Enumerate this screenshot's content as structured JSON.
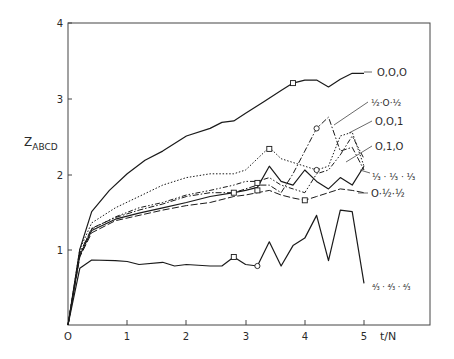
{
  "chart_data": {
    "type": "line",
    "title": "",
    "xlabel": "t/N",
    "ylabel": "Z_ABCD",
    "ylabel_main": "Z",
    "ylabel_sub": "ABCD",
    "xlim": [
      0,
      6.1
    ],
    "ylim": [
      0,
      4
    ],
    "x_ticks": [
      0,
      1,
      2,
      3,
      4,
      5
    ],
    "x_tick_labels": [
      "O",
      "1",
      "2",
      "3",
      "4",
      "5"
    ],
    "y_ticks": [
      1,
      2,
      3,
      4
    ],
    "y_tick_labels": [
      "1",
      "2",
      "3",
      "4"
    ],
    "grid": false,
    "legend_position": "inline labels at right end of each curve",
    "series": [
      {
        "name": "0,0,0",
        "label": "O,O,O",
        "style": "solid",
        "x": [
          0,
          0.2,
          0.4,
          0.7,
          1.0,
          1.3,
          1.6,
          2.0,
          2.4,
          2.6,
          2.8,
          3.0,
          3.3,
          3.6,
          3.8,
          4.0,
          4.2,
          4.4,
          4.6,
          4.8,
          5.0
        ],
        "y": [
          0,
          1.0,
          1.5,
          1.78,
          2.0,
          2.18,
          2.3,
          2.5,
          2.6,
          2.68,
          2.7,
          2.8,
          2.95,
          3.1,
          3.2,
          3.24,
          3.24,
          3.15,
          3.25,
          3.33,
          3.33
        ],
        "markers": [
          {
            "x": 3.8,
            "y": 3.2,
            "shape": "square"
          }
        ]
      },
      {
        "name": "1/2,0,1/2",
        "label": "½·O·½",
        "style": "dash-dot",
        "x": [
          0,
          0.2,
          0.4,
          0.8,
          1.2,
          1.6,
          2.0,
          2.4,
          2.8,
          3.0,
          3.2,
          3.4,
          3.6,
          3.8,
          4.0,
          4.2,
          4.4,
          4.6,
          4.8,
          5.0
        ],
        "y": [
          0,
          0.95,
          1.28,
          1.42,
          1.52,
          1.6,
          1.7,
          1.75,
          1.75,
          1.8,
          1.85,
          1.85,
          1.75,
          2.0,
          2.3,
          2.6,
          2.75,
          2.3,
          2.35,
          2.05
        ],
        "markers": [
          {
            "x": 4.2,
            "y": 2.6,
            "shape": "circle"
          }
        ]
      },
      {
        "name": "0,0,1",
        "label": "O,O,1",
        "style": "dotted",
        "x": [
          0,
          0.2,
          0.4,
          0.8,
          1.2,
          1.6,
          2.0,
          2.4,
          2.8,
          3.0,
          3.4,
          3.6,
          3.8,
          4.0,
          4.2,
          4.4,
          4.6,
          4.8,
          5.0
        ],
        "y": [
          0,
          1.0,
          1.35,
          1.55,
          1.7,
          1.85,
          1.95,
          2.0,
          2.0,
          2.05,
          2.35,
          2.2,
          2.15,
          2.1,
          2.05,
          2.1,
          2.5,
          2.55,
          2.1
        ],
        "markers": [
          {
            "x": 3.4,
            "y": 2.33,
            "shape": "square"
          }
        ]
      },
      {
        "name": "0,1,0",
        "label": "O,1,O",
        "style": "dash-dot-dot",
        "x": [
          0,
          0.2,
          0.4,
          0.8,
          1.2,
          1.6,
          2.0,
          2.4,
          2.8,
          3.0,
          3.2,
          3.4,
          3.6,
          3.8,
          4.0,
          4.2,
          4.4,
          4.6,
          4.8,
          5.0
        ],
        "y": [
          0,
          0.95,
          1.27,
          1.43,
          1.55,
          1.62,
          1.72,
          1.78,
          1.85,
          1.9,
          1.9,
          1.95,
          1.85,
          1.8,
          1.75,
          2.0,
          2.05,
          2.25,
          2.5,
          2.2
        ],
        "markers": [
          {
            "x": 4.2,
            "y": 2.05,
            "shape": "circle"
          }
        ]
      },
      {
        "name": "1/3,1/3,1/3",
        "label": "⅓·⅓·⅓",
        "style": "solid",
        "x": [
          0,
          0.2,
          0.4,
          0.8,
          1.2,
          1.6,
          2.0,
          2.4,
          2.8,
          3.0,
          3.2,
          3.4,
          3.6,
          3.8,
          4.0,
          4.2,
          4.4,
          4.6,
          4.8,
          5.0
        ],
        "y": [
          0,
          0.92,
          1.25,
          1.4,
          1.48,
          1.55,
          1.62,
          1.7,
          1.75,
          1.78,
          1.82,
          2.1,
          1.9,
          1.85,
          2.05,
          1.9,
          1.8,
          1.95,
          1.85,
          2.1
        ],
        "markers": [
          {
            "x": 2.8,
            "y": 1.75,
            "shape": "square"
          },
          {
            "x": 3.2,
            "y": 1.88,
            "shape": "square"
          }
        ]
      },
      {
        "name": "0,1/2,1/2",
        "label": "O·½·½",
        "style": "long-dash",
        "x": [
          0,
          0.2,
          0.4,
          0.8,
          1.2,
          1.6,
          2.0,
          2.4,
          2.8,
          3.0,
          3.2,
          3.4,
          3.6,
          3.8,
          4.0,
          4.2,
          4.4,
          4.6,
          4.8,
          5.0
        ],
        "y": [
          0,
          0.9,
          1.22,
          1.38,
          1.45,
          1.52,
          1.58,
          1.62,
          1.7,
          1.72,
          1.75,
          1.78,
          1.72,
          1.68,
          1.65,
          1.7,
          1.75,
          1.8,
          1.78,
          1.75
        ],
        "markers": [
          {
            "x": 3.2,
            "y": 1.78,
            "shape": "square"
          },
          {
            "x": 4.0,
            "y": 1.65,
            "shape": "square"
          }
        ]
      },
      {
        "name": "4/3,4/3,4/3",
        "label": "⁴⁄₃·⁴⁄₃·⁴⁄₃",
        "style": "solid",
        "x": [
          0,
          0.2,
          0.4,
          0.8,
          1.0,
          1.2,
          1.6,
          1.8,
          2.0,
          2.4,
          2.6,
          2.8,
          3.0,
          3.2,
          3.4,
          3.6,
          3.8,
          4.0,
          4.2,
          4.4,
          4.6,
          4.8,
          5.0
        ],
        "y": [
          0,
          0.75,
          0.86,
          0.85,
          0.84,
          0.8,
          0.83,
          0.78,
          0.8,
          0.78,
          0.78,
          0.9,
          0.8,
          0.78,
          1.1,
          0.78,
          1.05,
          1.15,
          1.45,
          0.85,
          1.52,
          1.5,
          0.55
        ],
        "markers": [
          {
            "x": 2.8,
            "y": 0.9,
            "shape": "square"
          },
          {
            "x": 3.2,
            "y": 0.78,
            "shape": "circle"
          }
        ]
      }
    ]
  },
  "labels": {
    "ylabel_main": "Z",
    "ylabel_sub": "ABCD",
    "xlabel": "t/N",
    "origin": "O",
    "x1": "1",
    "x2": "2",
    "x3": "3",
    "x4": "4",
    "x5": "5",
    "y1": "1",
    "y2": "2",
    "y3": "3",
    "y4": "4",
    "s0": "O,O,O",
    "s1a": "½",
    "s1b": "·O·",
    "s1c": "½",
    "s2": "O,O,1",
    "s3": "O,1,O",
    "s4": "⅓ · ⅓ · ⅓",
    "s5": "O·½·½",
    "s6": "⁴⁄₃ · ⁴⁄₃ · ⁴⁄₃"
  }
}
